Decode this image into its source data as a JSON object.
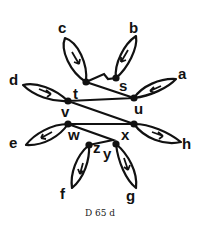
{
  "diagram": {
    "caption": "D 65 d",
    "colors": {
      "ink": "#111111",
      "background": "#ffffff"
    },
    "nodes": [
      {
        "id": "t",
        "label": "t"
      },
      {
        "id": "s",
        "label": "s"
      },
      {
        "id": "u",
        "label": "u"
      },
      {
        "id": "v",
        "label": "v"
      },
      {
        "id": "w",
        "label": "w"
      },
      {
        "id": "x",
        "label": "x"
      },
      {
        "id": "z",
        "label": "z"
      },
      {
        "id": "y",
        "label": "y"
      }
    ],
    "petals": [
      {
        "id": "a",
        "label": "a",
        "attached_to": "u"
      },
      {
        "id": "b",
        "label": "b",
        "attached_to": "s"
      },
      {
        "id": "c",
        "label": "c",
        "attached_to": "t"
      },
      {
        "id": "d",
        "label": "d",
        "attached_to": "v"
      },
      {
        "id": "e",
        "label": "e",
        "attached_to": "x"
      },
      {
        "id": "f",
        "label": "f",
        "attached_to": "z"
      },
      {
        "id": "g",
        "label": "g",
        "attached_to": "y"
      },
      {
        "id": "h",
        "label": "h",
        "attached_to": "w"
      }
    ],
    "zigzag_path": [
      "t",
      "s",
      "u",
      "v",
      "w",
      "x",
      "y",
      "z"
    ]
  }
}
